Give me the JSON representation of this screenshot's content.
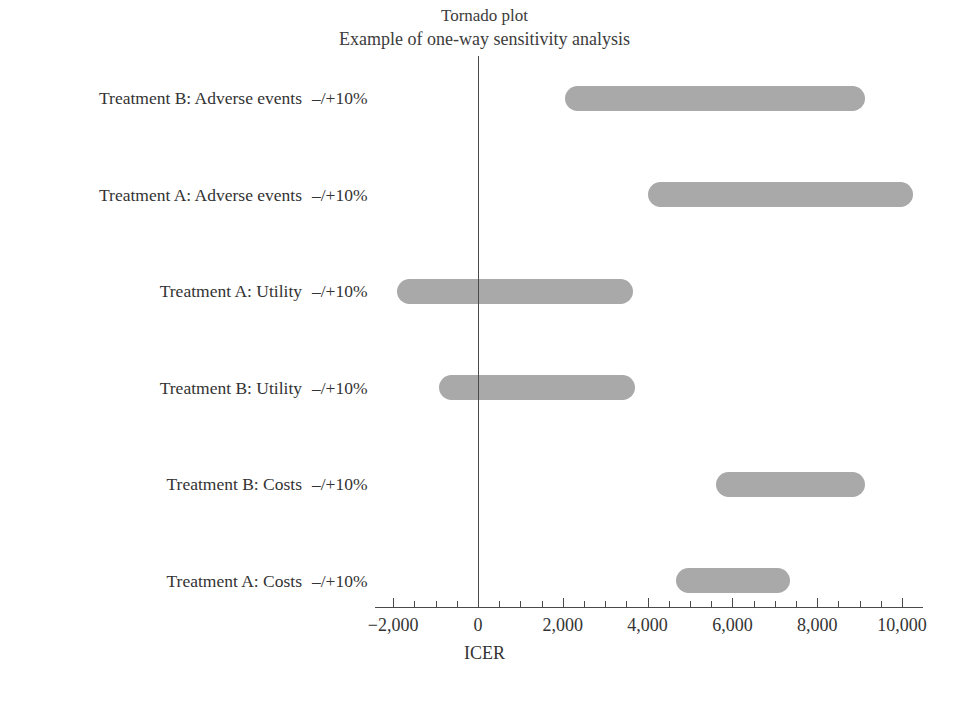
{
  "chart_data": {
    "type": "bar",
    "orientation": "horizontal",
    "variant": "tornado",
    "title": "Tornado plot",
    "subtitle": "Example of one-way sensitivity analysis",
    "xlabel": "ICER",
    "ylabel": "",
    "xlim": [
      -2250,
      10400
    ],
    "grid": false,
    "legend": null,
    "zero_reference_line": 0,
    "xticks": [
      -2000,
      0,
      2000,
      4000,
      6000,
      8000,
      10000
    ],
    "xticklabels": [
      "−2,000",
      "0",
      "2,000",
      "4,000",
      "6,000",
      "8,000",
      "10,000"
    ],
    "minor_tick_interval": 500,
    "bar_color": "#a9a9a9",
    "axis_color": "#4a4a4a",
    "categories": [
      "Treatment B: Adverse events",
      "Treatment A: Adverse events",
      "Treatment A: Utility",
      "Treatment B: Utility",
      "Treatment B: Costs",
      "Treatment A: Costs"
    ],
    "range_labels": [
      "–/+10%",
      "–/+10%",
      "–/+10%",
      "–/+10%",
      "–/+10%",
      "–/+10%"
    ],
    "bars": [
      {
        "label": "Treatment B: Adverse events",
        "range": "–/+10%",
        "low": 2050,
        "high": 9130
      },
      {
        "label": "Treatment A: Adverse events",
        "range": "–/+10%",
        "low": 4010,
        "high": 10260
      },
      {
        "label": "Treatment A: Utility",
        "range": "–/+10%",
        "low": -1910,
        "high": 3660
      },
      {
        "label": "Treatment B: Utility",
        "range": "–/+10%",
        "low": -920,
        "high": 3700
      },
      {
        "label": "Treatment B: Costs",
        "range": "–/+10%",
        "low": 5610,
        "high": 9130
      },
      {
        "label": "Treatment A: Costs",
        "range": "–/+10%",
        "low": 4670,
        "high": 7360
      }
    ]
  }
}
